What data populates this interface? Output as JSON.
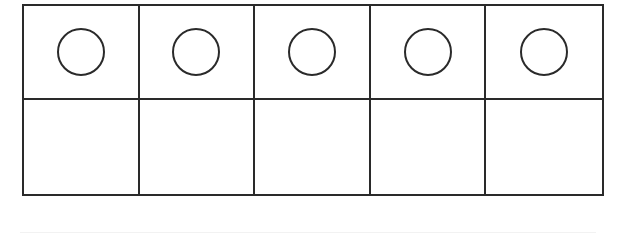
{
  "diagram": {
    "type": "ten-frame",
    "rows": 2,
    "columns": 5,
    "line_color": "#2a2a2a",
    "background": "#ffffff",
    "cells": [
      {
        "row": 0,
        "col": 0,
        "counter": true
      },
      {
        "row": 0,
        "col": 1,
        "counter": true
      },
      {
        "row": 0,
        "col": 2,
        "counter": true
      },
      {
        "row": 0,
        "col": 3,
        "counter": true
      },
      {
        "row": 0,
        "col": 4,
        "counter": true
      },
      {
        "row": 1,
        "col": 0,
        "counter": false
      },
      {
        "row": 1,
        "col": 1,
        "counter": false
      },
      {
        "row": 1,
        "col": 2,
        "counter": false
      },
      {
        "row": 1,
        "col": 3,
        "counter": false
      },
      {
        "row": 1,
        "col": 4,
        "counter": false
      }
    ],
    "counter_count": 5,
    "counter_shape": "circle-outline"
  }
}
